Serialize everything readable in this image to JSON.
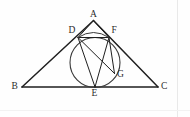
{
  "figure": {
    "kind": "geometry-diagram",
    "background_color": "#fefefe",
    "stroke_color": "#1f1f1f",
    "label_color": "#2b2b2b",
    "width": 190,
    "height": 117
  },
  "points": [
    {
      "id": "A",
      "label": "A",
      "x": 93.5,
      "y": 20.5,
      "label_x": 90.0,
      "label_y": 9.5
    },
    {
      "id": "B",
      "label": "B",
      "x": 22.0,
      "y": 87.0,
      "label_x": 11.5,
      "label_y": 82.0
    },
    {
      "id": "C",
      "label": "C",
      "x": 158.0,
      "y": 87.0,
      "label_x": 161.0,
      "label_y": 82.0
    },
    {
      "id": "D",
      "label": "D",
      "x": 78.0,
      "y": 37.5,
      "label_x": 68.5,
      "label_y": 25.5
    },
    {
      "id": "E",
      "label": "E",
      "x": 95.0,
      "y": 87.0,
      "label_x": 91.5,
      "label_y": 89.0
    },
    {
      "id": "F",
      "label": "F",
      "x": 109.0,
      "y": 37.5,
      "label_x": 111.5,
      "label_y": 25.5
    },
    {
      "id": "G",
      "label": "G",
      "x": 114.5,
      "y": 73.5,
      "label_x": 117.0,
      "label_y": 69.5
    }
  ],
  "circle": {
    "id": "circumcircle-DFEG",
    "center_x": 95.0,
    "center_y": 62.5,
    "radius": 25.0
  },
  "segments": [
    {
      "id": "side-AB",
      "from": "A",
      "to": "B",
      "weight": 1.5
    },
    {
      "id": "side-AC",
      "from": "A",
      "to": "C",
      "weight": 1.5
    },
    {
      "id": "side-BC",
      "from": "B",
      "to": "C",
      "weight": 1.5
    },
    {
      "id": "chord-DF",
      "from": "D",
      "to": "F",
      "weight": 1.0
    },
    {
      "id": "chord-DE",
      "from": "D",
      "to": "E",
      "weight": 1.0
    },
    {
      "id": "chord-FE",
      "from": "F",
      "to": "E",
      "weight": 1.0
    },
    {
      "id": "chord-DG",
      "from": "D",
      "to": "G",
      "weight": 1.0
    },
    {
      "id": "chord-FG",
      "from": "F",
      "to": "G",
      "weight": 1.0
    },
    {
      "id": "chord-AD-to-F",
      "from": "A",
      "to": "F",
      "weight": 1.0
    },
    {
      "id": "chord-AE",
      "from": "A",
      "to": "D",
      "weight": 1.0
    }
  ],
  "rules": {
    "right_rule_x": 177,
    "bottom_rule_y": 110
  }
}
